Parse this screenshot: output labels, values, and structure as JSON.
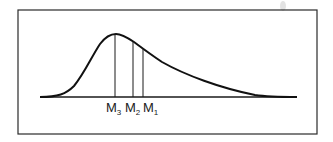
{
  "diagram": {
    "title": "",
    "markers": [
      {
        "id": "M3",
        "base": "M",
        "sub": "3",
        "x": 115
      },
      {
        "id": "M2",
        "base": "M",
        "sub": "2",
        "x": 133
      },
      {
        "id": "M1",
        "base": "M",
        "sub": "1",
        "x": 143
      }
    ],
    "colors": {
      "line": "#111111",
      "frame": "#2a2a2a",
      "background": "#ffffff"
    }
  }
}
